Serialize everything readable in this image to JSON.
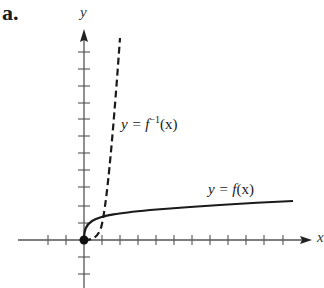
{
  "figure": {
    "part_label": "a.",
    "x_axis_label": "x",
    "y_axis_label": "y",
    "curves": [
      {
        "name": "f",
        "label_prefix": "y = ",
        "label_func": "f",
        "label_sup": "",
        "label_suffix": "(x)",
        "style": "solid"
      },
      {
        "name": "f-inverse",
        "label_prefix": "y = ",
        "label_func": "f",
        "label_sup": "−1",
        "label_suffix": "(x)",
        "style": "dashed"
      }
    ],
    "origin_point": "filled-dot",
    "colors": {
      "ink": "#1a1a1a",
      "axis": "#555555",
      "background": "#ffffff"
    }
  }
}
